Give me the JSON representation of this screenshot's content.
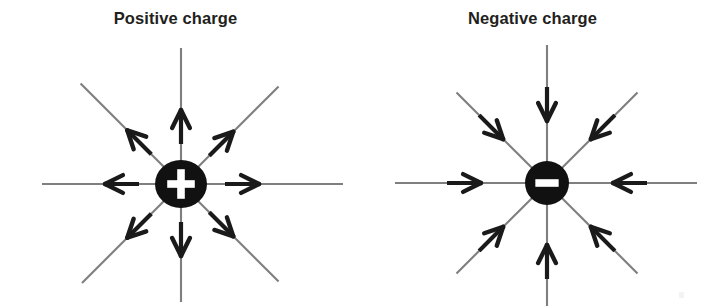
{
  "figure": {
    "background_color": "#ffffff",
    "ink_color": "#1a1a1a",
    "shaft_color": "#6e6e6e",
    "width": 702,
    "height": 306
  },
  "panels": [
    {
      "id": "positive",
      "title": "Positive charge",
      "charge_sign": "+",
      "charge_symbol": "plus-symbol",
      "field_direction": "outward",
      "center": {
        "x": 181,
        "y": 184
      },
      "charge_marker": {
        "shape": "ellipse",
        "rx": 26,
        "ry": 24,
        "fill": "#111111",
        "symbol_fill": "#ffffff"
      },
      "field_lines": [
        {
          "name": "field-line-right",
          "angle_deg": 0,
          "length": 162,
          "arrow_at": 78
        },
        {
          "name": "field-line-up-right",
          "angle_deg": 315,
          "length": 138,
          "arrow_at": 74
        },
        {
          "name": "field-line-up",
          "angle_deg": 270,
          "length": 136,
          "arrow_at": 74
        },
        {
          "name": "field-line-up-left",
          "angle_deg": 225,
          "length": 142,
          "arrow_at": 76
        },
        {
          "name": "field-line-left",
          "angle_deg": 180,
          "length": 139,
          "arrow_at": 76
        },
        {
          "name": "field-line-down-left",
          "angle_deg": 135,
          "length": 140,
          "arrow_at": 76
        },
        {
          "name": "field-line-down",
          "angle_deg": 90,
          "length": 118,
          "arrow_at": 72
        },
        {
          "name": "field-line-down-right",
          "angle_deg": 45,
          "length": 138,
          "arrow_at": 74
        }
      ]
    },
    {
      "id": "negative",
      "title": "Negative charge",
      "charge_sign": "−",
      "charge_symbol": "minus-symbol",
      "field_direction": "inward",
      "center": {
        "x": 196,
        "y": 183
      },
      "charge_marker": {
        "shape": "circle",
        "rx": 22,
        "ry": 22,
        "fill": "#111111",
        "symbol_fill": "#ffffff"
      },
      "field_lines": [
        {
          "name": "field-line-right",
          "angle_deg": 0,
          "length": 150,
          "arrow_at": 66
        },
        {
          "name": "field-line-up-right",
          "angle_deg": 315,
          "length": 128,
          "arrow_at": 62
        },
        {
          "name": "field-line-up",
          "angle_deg": 270,
          "length": 138,
          "arrow_at": 62
        },
        {
          "name": "field-line-up-left",
          "angle_deg": 225,
          "length": 128,
          "arrow_at": 62
        },
        {
          "name": "field-line-left",
          "angle_deg": 180,
          "length": 152,
          "arrow_at": 66
        },
        {
          "name": "field-line-down-left",
          "angle_deg": 135,
          "length": 128,
          "arrow_at": 62
        },
        {
          "name": "field-line-down",
          "angle_deg": 90,
          "length": 126,
          "arrow_at": 62
        },
        {
          "name": "field-line-down-right",
          "angle_deg": 45,
          "length": 128,
          "arrow_at": 62
        }
      ]
    }
  ]
}
